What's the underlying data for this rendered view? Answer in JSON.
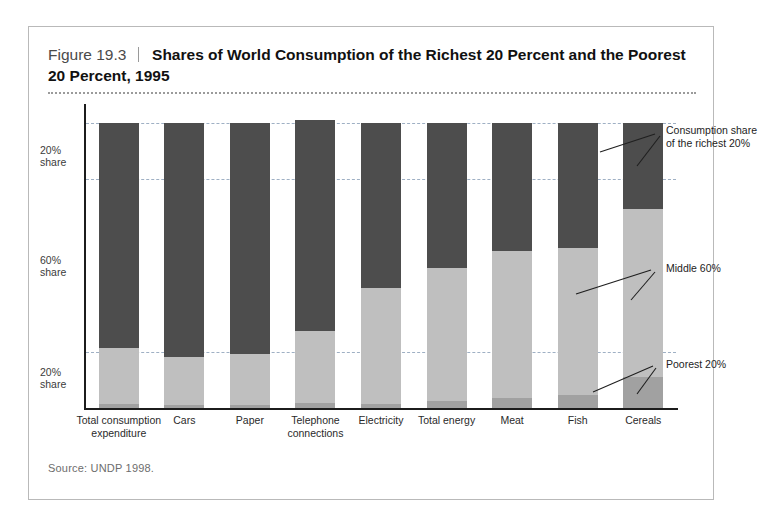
{
  "figure": {
    "number": "Figure 19.3",
    "title_line1": "Shares of World Consumption of the Richest 20 Percent and the Poorest",
    "title_line2": "20 Percent, 1995",
    "source": "Source: UNDP 1998."
  },
  "colors": {
    "richest": "#4d4d4d",
    "middle": "#bfbfbf",
    "poorest": "#a1a1a1",
    "gridline": "#9fb0c4",
    "axis": "#1c1c1c",
    "frame": "#b9b9b9"
  },
  "annotations": {
    "richest": "Consumption share of the richest 20%",
    "middle": "Middle 60%",
    "poorest": "Poorest 20%"
  },
  "axis": {
    "y_ticks": [
      {
        "label_line1": "20%",
        "label_line2": "share"
      },
      {
        "label_line1": "60%",
        "label_line2": "share"
      },
      {
        "label_line1": "20%",
        "label_line2": "share"
      }
    ]
  },
  "chart_data": {
    "type": "bar",
    "title": "Shares of World Consumption of the Richest 20 Percent and the Poorest 20 Percent, 1995",
    "subtitle": "Figure 19.3",
    "stacked": true,
    "stack_total": 100,
    "xlabel": "",
    "ylabel": "",
    "ylim": [
      0,
      100
    ],
    "grid": true,
    "gridlines": [
      20,
      80
    ],
    "legend": "annotated-callouts",
    "categories": [
      "Total consumption expenditure",
      "Cars",
      "Paper",
      "Telephone connections",
      "Electricity",
      "Total energy",
      "Meat",
      "Fish",
      "Cereals"
    ],
    "series": [
      {
        "name": "Consumption share of the richest 20%",
        "color": "#4d4d4d",
        "values": [
          79,
          82,
          81,
          74,
          58,
          51,
          45,
          44,
          30
        ]
      },
      {
        "name": "Middle 60%",
        "color": "#bfbfbf",
        "values": [
          19.7,
          16.9,
          17.9,
          25.4,
          40.5,
          46.5,
          51.6,
          51.5,
          59
        ]
      },
      {
        "name": "Poorest 20%",
        "color": "#a1a1a1",
        "values": [
          1.3,
          1.1,
          1.1,
          1.6,
          1.5,
          2.5,
          3.4,
          4.5,
          11
        ]
      }
    ]
  }
}
